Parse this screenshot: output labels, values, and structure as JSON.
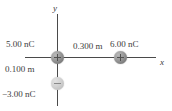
{
  "figure": {
    "background_color": "#ffffff"
  },
  "axes": {
    "x_label": "x",
    "y_label": "y",
    "line_color": "#4a4a4a"
  },
  "charges": [
    {
      "id": "origin",
      "label": "5.00 nC",
      "sign": "+",
      "polarity": "positive",
      "position": "origin",
      "color": "#8a8a8a"
    },
    {
      "id": "right",
      "label": "6.00 nC",
      "sign": "+",
      "polarity": "positive",
      "position": "on positive x-axis",
      "color": "#8a8a8a"
    },
    {
      "id": "bottom",
      "label": "−3.00 nC",
      "sign": "−",
      "polarity": "negative",
      "position": "on negative y-axis",
      "color": "#cccccc"
    }
  ],
  "distances": [
    {
      "id": "horizontal",
      "label": "0.300 m",
      "between": "origin charge and right charge"
    },
    {
      "id": "vertical",
      "label": "0.100 m",
      "between": "origin charge and bottom charge"
    }
  ],
  "chart_data": {
    "type": "scatter",
    "title": "",
    "xlabel": "x",
    "ylabel": "y",
    "grid": false,
    "legend": "none",
    "points": [
      {
        "x": 0.0,
        "y": 0.0,
        "value": "5.00 nC",
        "sign": "+"
      },
      {
        "x": 0.3,
        "y": 0.0,
        "value": "6.00 nC",
        "sign": "+"
      },
      {
        "x": 0.0,
        "y": -0.1,
        "value": "−3.00 nC",
        "sign": "−"
      }
    ],
    "annotations": [
      "0.300 m",
      "0.100 m"
    ],
    "xlim": [
      -0.075,
      0.46
    ],
    "ylim": [
      -0.2,
      0.2
    ]
  }
}
